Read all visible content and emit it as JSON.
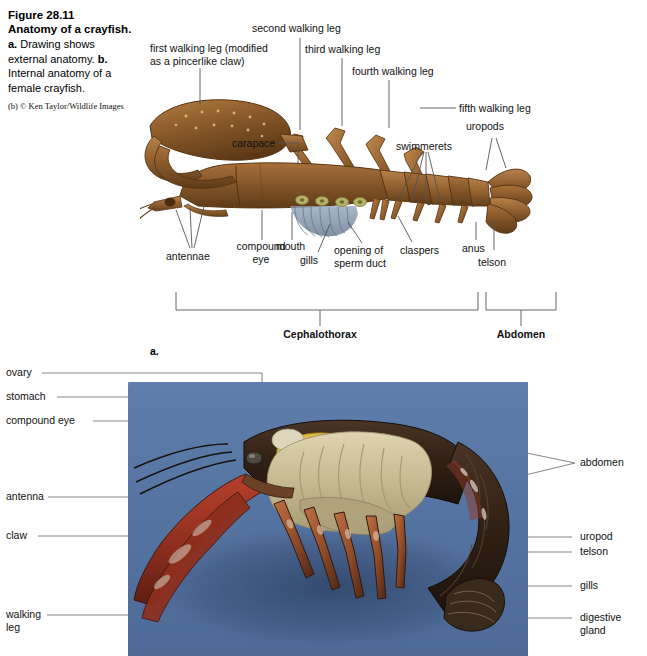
{
  "figure": {
    "number": "Figure 28.11",
    "title": "Anatomy of a crayfish.",
    "description_a_prefix": "a.",
    "description_a": " Drawing shows external anatomy. ",
    "description_b_prefix": "b.",
    "description_b": " Internal anatomy of a female crayfish.",
    "credit": "(b) © Ken Taylor/Wildlife Images",
    "part_a_marker": "a."
  },
  "part_a": {
    "labels_top": [
      {
        "id": "first-walking-leg",
        "text": "first walking leg (modified\nas a pincerlike claw)"
      },
      {
        "id": "second-walking-leg",
        "text": "second walking leg"
      },
      {
        "id": "third-walking-leg",
        "text": "third walking leg"
      },
      {
        "id": "fourth-walking-leg",
        "text": "fourth walking leg"
      },
      {
        "id": "fifth-walking-leg",
        "text": "fifth walking leg"
      },
      {
        "id": "uropods",
        "text": "uropods"
      },
      {
        "id": "swimmerets",
        "text": "swimmerets"
      }
    ],
    "labels_inner": [
      {
        "id": "carapace",
        "text": "carapace"
      }
    ],
    "labels_bottom": [
      {
        "id": "antennae",
        "text": "antennae"
      },
      {
        "id": "compound-eye",
        "text": "compound\neye"
      },
      {
        "id": "mouth",
        "text": "mouth"
      },
      {
        "id": "gills",
        "text": "gills"
      },
      {
        "id": "opening-of-sperm-duct",
        "text": "opening of\nsperm duct"
      },
      {
        "id": "claspers",
        "text": "claspers"
      },
      {
        "id": "anus",
        "text": "anus"
      },
      {
        "id": "telson",
        "text": "telson"
      }
    ],
    "regions": [
      {
        "id": "cephalothorax",
        "text": "Cephalothorax"
      },
      {
        "id": "abdomen",
        "text": "Abdomen"
      }
    ]
  },
  "part_b": {
    "labels_left": [
      {
        "id": "ovary",
        "text": "ovary"
      },
      {
        "id": "stomach",
        "text": "stomach"
      },
      {
        "id": "compound-eye",
        "text": "compound eye"
      },
      {
        "id": "antenna",
        "text": "antenna"
      },
      {
        "id": "claw",
        "text": "claw"
      },
      {
        "id": "walking-leg",
        "text": "walking\nleg"
      }
    ],
    "labels_right": [
      {
        "id": "abdomen",
        "text": "abdomen"
      },
      {
        "id": "uropod",
        "text": "uropod"
      },
      {
        "id": "telson",
        "text": "telson"
      },
      {
        "id": "gills",
        "text": "gills"
      },
      {
        "id": "digestive-gland",
        "text": "digestive\ngland"
      }
    ]
  },
  "colors": {
    "photo_background": "#5b7bab",
    "drawing_body": "#8b5a2b",
    "drawing_body_dark": "#5e3b18",
    "drawing_body_light": "#c08a4e",
    "gill_blue": "#7d90a8",
    "leader_line": "#555555",
    "text": "#111111",
    "shell_red": "#a8342a",
    "shell_dark": "#3a2418",
    "organ_tan": "#c9bb94"
  }
}
